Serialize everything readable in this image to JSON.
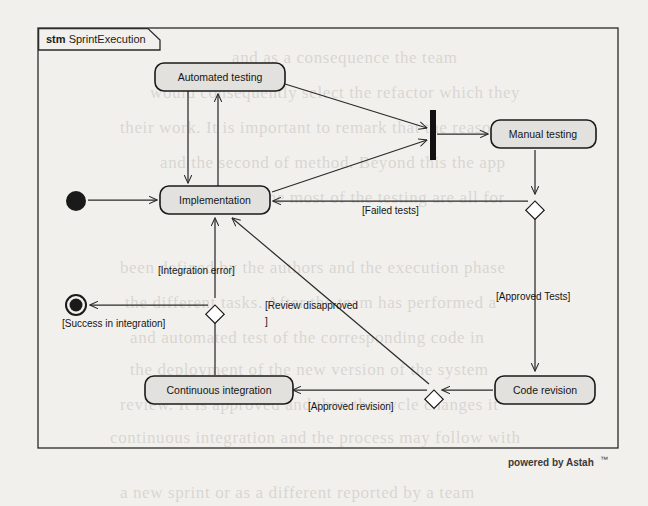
{
  "diagram": {
    "kind_keyword": "stm",
    "name": "SprintExecution",
    "type": "uml-state-machine",
    "tool_watermark": "powered by Astah",
    "watermark_mark": "™"
  },
  "states": [
    {
      "id": "automated_testing",
      "label": "Automated   testing",
      "x": 155,
      "y": 63,
      "w": 130,
      "h": 28
    },
    {
      "id": "implementation",
      "label": "Implementation",
      "x": 160,
      "y": 186,
      "w": 110,
      "h": 28
    },
    {
      "id": "manual_testing",
      "label": "Manual testing",
      "x": 491,
      "y": 122,
      "w": 105,
      "h": 28
    },
    {
      "id": "code_revision",
      "label": "Code revision",
      "x": 495,
      "y": 375,
      "w": 100,
      "h": 28
    },
    {
      "id": "continuous_integration",
      "label": "Continuous integration",
      "x": 142,
      "y": 375,
      "w": 148,
      "h": 28
    }
  ],
  "pseudostates": [
    {
      "id": "initial",
      "kind": "initial-state",
      "cx": 76,
      "cy": 201,
      "r": 10
    },
    {
      "id": "final",
      "kind": "final-state",
      "cx": 76,
      "cy": 305,
      "r": 10
    },
    {
      "id": "join",
      "kind": "join-bar",
      "x": 430,
      "y": 110,
      "w": 6,
      "h": 50
    },
    {
      "id": "junction_right",
      "kind": "junction",
      "cx": 535,
      "cy": 201
    },
    {
      "id": "junction_left",
      "kind": "junction",
      "cx": 215,
      "cy": 305
    },
    {
      "id": "junction_bottom",
      "kind": "junction",
      "cx": 434,
      "cy": 390
    }
  ],
  "transitions": [
    {
      "id": "t_init_impl",
      "from": "initial",
      "to": "implementation",
      "guard": ""
    },
    {
      "id": "t_impl_automated",
      "from": "implementation",
      "to": "automated_testing",
      "guard": ""
    },
    {
      "id": "t_automated_impl",
      "from": "automated_testing",
      "to": "implementation",
      "guard": ""
    },
    {
      "id": "t_automated_join",
      "from": "automated_testing",
      "to": "join",
      "guard": ""
    },
    {
      "id": "t_impl_join",
      "from": "implementation",
      "to": "join",
      "guard": ""
    },
    {
      "id": "t_join_manual",
      "from": "join",
      "to": "manual_testing",
      "guard": ""
    },
    {
      "id": "t_manual_junction",
      "from": "manual_testing",
      "to": "junction_right",
      "guard": ""
    },
    {
      "id": "t_failed_tests",
      "from": "junction_right",
      "to": "implementation",
      "guard": "[Failed tests]"
    },
    {
      "id": "t_approved_tests",
      "from": "junction_right",
      "to": "code_revision",
      "guard": "[Approved Tests]"
    },
    {
      "id": "t_review_disapproved",
      "from": "junction_bottom",
      "to": "implementation",
      "guard": "[Review disapproved\n]"
    },
    {
      "id": "t_approved_revision",
      "from": "code_revision",
      "to": "continuous_integration",
      "guard": "[Approved revision]"
    },
    {
      "id": "t_ci_junction",
      "from": "continuous_integration",
      "to": "junction_left",
      "guard": ""
    },
    {
      "id": "t_integration_error",
      "from": "junction_left",
      "to": "implementation",
      "guard": "[Integration error]"
    },
    {
      "id": "t_success",
      "from": "junction_left",
      "to": "final",
      "guard": "[Success in integration]"
    }
  ],
  "labels": {
    "failed_tests": "[Failed tests]",
    "approved_tests": "[Approved Tests]",
    "integration_error": "[Integration error]",
    "success_in_integration": "[Success in integration]",
    "review_disapproved_line1": "[Review disapproved",
    "review_disapproved_line2": "]",
    "approved_revision": "[Approved revision]"
  },
  "bleed_text": [
    {
      "t": "and as a consequence the team",
      "x": 232,
      "y": 40
    },
    {
      "t": "would consequently select the refactor which they",
      "x": 150,
      "y": 75
    },
    {
      "t": "their work. It is important to remark that the reason",
      "x": 120,
      "y": 110
    },
    {
      "t": "and the second of method. Beyond this the app",
      "x": 160,
      "y": 145
    },
    {
      "t": "in this case, the most of the testing are all for",
      "x": 170,
      "y": 180
    },
    {
      "t": "been defined by the authors and the execution phase",
      "x": 120,
      "y": 250
    },
    {
      "t": "the different tasks. After the team has performed a",
      "x": 125,
      "y": 285
    },
    {
      "t": "and automated test of the corresponding code in",
      "x": 130,
      "y": 320
    },
    {
      "t": "the deployment of the new version of the system",
      "x": 130,
      "y": 352
    },
    {
      "t": "review. It is approved and then the cycle changes it",
      "x": 120,
      "y": 387
    },
    {
      "t": "continuous integration and the process may follow with",
      "x": 110,
      "y": 420
    },
    {
      "t": "a new sprint or as a different reported by a team",
      "x": 120,
      "y": 475
    }
  ],
  "colors": {
    "page_background": "#f2f0ec",
    "frame_stroke": "#2a2a2a",
    "state_fill": "#e3e1dd",
    "state_stroke": "#1a1a1a",
    "edge_stroke": "#2a2a2a",
    "text": "#151515"
  }
}
